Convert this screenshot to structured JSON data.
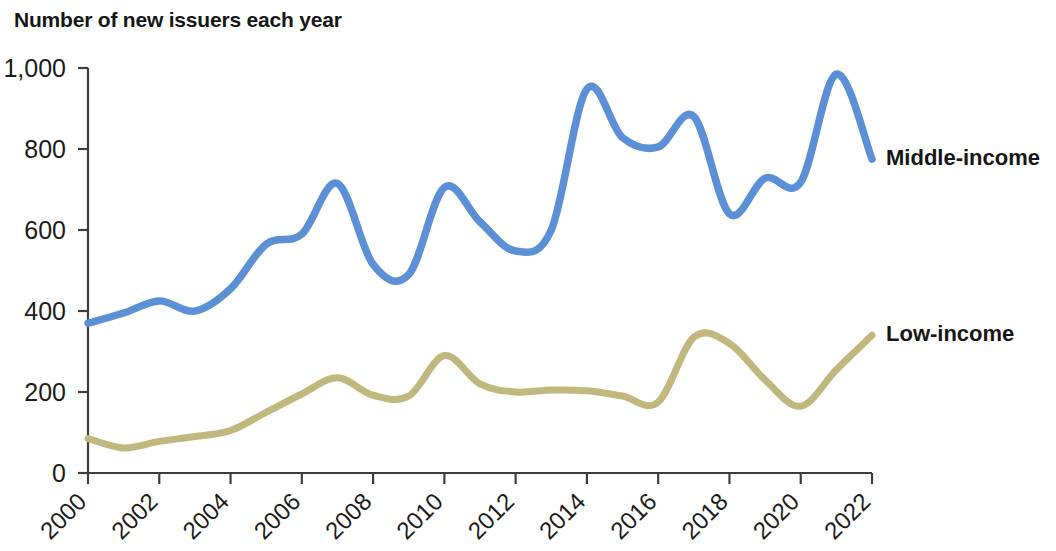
{
  "chart_data": {
    "type": "line",
    "title": "Number of new issuers each year",
    "xlabel": "",
    "ylabel": "",
    "xlim": [
      2000,
      2022
    ],
    "ylim": [
      0,
      1000
    ],
    "grid": false,
    "legend_position": "right-inline",
    "x": [
      2000,
      2001,
      2002,
      2003,
      2004,
      2005,
      2006,
      2007,
      2008,
      2009,
      2010,
      2011,
      2012,
      2013,
      2014,
      2015,
      2016,
      2017,
      2018,
      2019,
      2020,
      2021,
      2022
    ],
    "xticks": [
      "2000",
      "2002",
      "2004",
      "2006",
      "2008",
      "2010",
      "2012",
      "2014",
      "2016",
      "2018",
      "2020",
      "2022"
    ],
    "xtick_values": [
      2000,
      2002,
      2004,
      2006,
      2008,
      2010,
      2012,
      2014,
      2016,
      2018,
      2020,
      2022
    ],
    "yticks": [
      "0",
      "200",
      "400",
      "600",
      "800",
      "1,000"
    ],
    "ytick_values": [
      0,
      200,
      400,
      600,
      800,
      1000
    ],
    "series": [
      {
        "name": "Middle-income",
        "color": "#5b8fd6",
        "values": [
          370,
          395,
          425,
          400,
          455,
          565,
          590,
          715,
          515,
          490,
          705,
          620,
          548,
          600,
          948,
          828,
          805,
          880,
          640,
          728,
          718,
          985,
          775
        ]
      },
      {
        "name": "Low-income",
        "color": "#c0b87e",
        "values": [
          85,
          62,
          78,
          90,
          105,
          150,
          195,
          235,
          192,
          190,
          290,
          220,
          200,
          205,
          203,
          190,
          175,
          335,
          320,
          230,
          165,
          255,
          340
        ]
      }
    ]
  },
  "legend": {
    "middle_income_label": "Middle-income",
    "low_income_label": "Low-income"
  }
}
